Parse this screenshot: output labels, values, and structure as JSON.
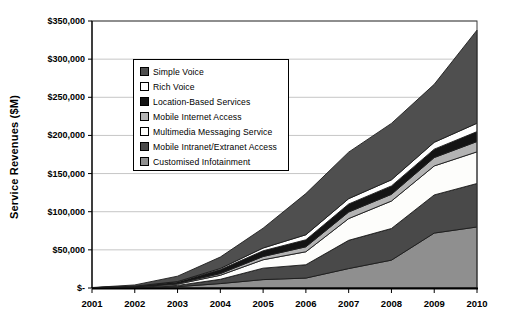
{
  "chart_data": {
    "type": "area",
    "stacked": true,
    "title": "",
    "xlabel": "",
    "ylabel": "Service Revenues ($M)",
    "x": [
      2001,
      2002,
      2003,
      2004,
      2005,
      2006,
      2007,
      2008,
      2009,
      2010
    ],
    "ylim": [
      0,
      350000
    ],
    "grid": true,
    "legend_position": "upper-left-inside",
    "y_axis": {
      "tick_labels": [
        "$350,000",
        "$300,000",
        "$250,000",
        "$200,000",
        "$150,000",
        "$100,000",
        "$50,000",
        "$-"
      ],
      "tick_values": [
        350000,
        300000,
        250000,
        200000,
        150000,
        100000,
        50000,
        0
      ]
    },
    "x_axis": {
      "labels": [
        "2001",
        "2002",
        "2003",
        "2004",
        "2005",
        "2006",
        "2007",
        "2008",
        "2009",
        "2010"
      ]
    },
    "series": [
      {
        "name": "Simple Voice",
        "color": "#4f4f4f",
        "values": [
          200,
          1600,
          7000,
          15000,
          26000,
          54000,
          61000,
          74000,
          76000,
          122000
        ]
      },
      {
        "name": "Rich Voice",
        "color": "#ffffff",
        "values": [
          50,
          200,
          500,
          1500,
          3600,
          6600,
          7000,
          8000,
          9000,
          11000
        ]
      },
      {
        "name": "Location-Based Services",
        "color": "#141414",
        "values": [
          100,
          600,
          2000,
          5200,
          7500,
          9200,
          10500,
          11000,
          11000,
          13000
        ]
      },
      {
        "name": "Mobile Internet Access",
        "color": "#b3b3b3",
        "values": [
          50,
          300,
          1000,
          2200,
          4300,
          6500,
          8600,
          8800,
          11000,
          13500
        ]
      },
      {
        "name": "Multimedia Messaging Service",
        "color": "#fdfdfb",
        "values": [
          50,
          400,
          1600,
          5300,
          11000,
          17000,
          28500,
          36000,
          38000,
          41500
        ]
      },
      {
        "name": "Mobile Intranet/Extranet Access",
        "color": "#494949",
        "values": [
          50,
          500,
          1700,
          5600,
          15000,
          17500,
          37000,
          41500,
          50000,
          57000
        ]
      },
      {
        "name": "Customised Infotainment",
        "color": "#8f8f8f",
        "values": [
          100,
          400,
          1700,
          5800,
          11000,
          13000,
          25500,
          36500,
          72000,
          80000
        ]
      }
    ],
    "stack_note": "first series listed is top of stack; last series is bottom band"
  }
}
